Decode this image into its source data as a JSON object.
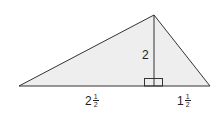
{
  "diagram": {
    "type": "triangle-with-altitude",
    "fill_color": "#eeeeee",
    "stroke_color": "#333333",
    "vertices": {
      "apex": [
        154,
        15
      ],
      "left": [
        19,
        86
      ],
      "right": [
        210,
        86
      ]
    },
    "altitude_foot": [
      154,
      86
    ],
    "labels": {
      "height": "2",
      "left_segment": {
        "whole": "2",
        "numerator": "1",
        "denominator": "2"
      },
      "right_segment": {
        "whole": "1",
        "numerator": "1",
        "denominator": "2"
      }
    }
  }
}
